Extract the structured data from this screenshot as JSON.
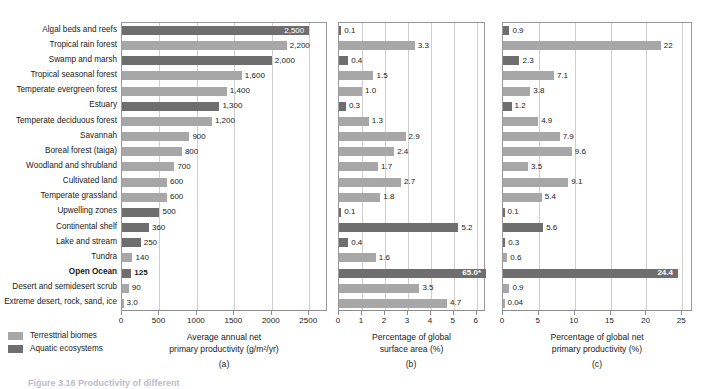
{
  "figure": {
    "caption_fragment": "Figure 3.16 Productivity of different",
    "legend": [
      {
        "key": "terrestrial",
        "label": "Terresttrial biomes",
        "color": "#a7a7a7"
      },
      {
        "key": "aquatic",
        "label": "Aquatic ecosystems",
        "color": "#6e6e6e"
      }
    ],
    "sub_captions": [
      "(a)",
      "(b)",
      "(c)"
    ]
  },
  "categories": [
    {
      "name": "Algal beds and reefs",
      "type": "aquatic",
      "bold": false
    },
    {
      "name": "Tropical rain forest",
      "type": "terrestrial",
      "bold": false
    },
    {
      "name": "Swamp and marsh",
      "type": "aquatic",
      "bold": false
    },
    {
      "name": "Tropical seasonal forest",
      "type": "terrestrial",
      "bold": false
    },
    {
      "name": "Temperate evergreen forest",
      "type": "terrestrial",
      "bold": false
    },
    {
      "name": "Estuary",
      "type": "aquatic",
      "bold": false
    },
    {
      "name": "Temperate deciduous forest",
      "type": "terrestrial",
      "bold": false
    },
    {
      "name": "Savannah",
      "type": "terrestrial",
      "bold": false
    },
    {
      "name": "Boreal forest (taiga)",
      "type": "terrestrial",
      "bold": false
    },
    {
      "name": "Woodland and shrubland",
      "type": "terrestrial",
      "bold": false
    },
    {
      "name": "Cultivated land",
      "type": "terrestrial",
      "bold": false
    },
    {
      "name": "Temperate grassland",
      "type": "terrestrial",
      "bold": false
    },
    {
      "name": "Upwelling zones",
      "type": "aquatic",
      "bold": false
    },
    {
      "name": "Continental shelf",
      "type": "aquatic",
      "bold": false
    },
    {
      "name": "Lake and stream",
      "type": "aquatic",
      "bold": false
    },
    {
      "name": "Tundra",
      "type": "terrestrial",
      "bold": false
    },
    {
      "name": "Open Ocean",
      "type": "aquatic",
      "bold": true
    },
    {
      "name": "Desert and semidesert scrub",
      "type": "terrestrial",
      "bold": false
    },
    {
      "name": "Extreme desert, rock, sand, ice",
      "type": "terrestrial",
      "bold": false
    }
  ],
  "chart_data": [
    {
      "id": "a",
      "type": "bar",
      "orientation": "horizontal",
      "title": "",
      "xlabel": "Average annual net primary productivity (g/m²/yr)",
      "xlabel_line1": "Average annual net",
      "xlabel_line2": "primary productivity (g/m²/yr)",
      "ylabel": "",
      "xlim": [
        0,
        2750
      ],
      "ticks": [
        0,
        500,
        1000,
        1500,
        2000,
        2500
      ],
      "ticklabels": [
        "0",
        "500",
        "1000",
        "1500",
        "2000",
        "2500"
      ],
      "grid": true,
      "legend_position": "bottom-left",
      "categories": [
        "Algal beds and reefs",
        "Tropical rain forest",
        "Swamp and marsh",
        "Tropical seasonal forest",
        "Temperate evergreen forest",
        "Estuary",
        "Temperate deciduous forest",
        "Savannah",
        "Boreal forest (taiga)",
        "Woodland and shrubland",
        "Cultivated land",
        "Temperate grassland",
        "Upwelling zones",
        "Continental shelf",
        "Lake and stream",
        "Tundra",
        "Open Ocean",
        "Desert and semidesert scrub",
        "Extreme desert, rock, sand, ice"
      ],
      "values": [
        2500,
        2200,
        2000,
        1600,
        1400,
        1300,
        1200,
        900,
        800,
        700,
        600,
        600,
        500,
        360,
        250,
        140,
        125,
        90,
        3.0
      ],
      "datalabels": [
        "2,500",
        "2,200",
        "2,000",
        "1,600",
        "1,400",
        "1,300",
        "1,200",
        "900",
        "800",
        "700",
        "600",
        "600",
        "500",
        "360",
        "250",
        "140",
        "125",
        "90",
        "3.0"
      ],
      "label_inside": [
        true,
        false,
        false,
        false,
        false,
        false,
        false,
        false,
        false,
        false,
        false,
        false,
        false,
        false,
        false,
        false,
        false,
        false,
        false
      ]
    },
    {
      "id": "b",
      "type": "bar",
      "orientation": "horizontal",
      "title": "",
      "xlabel": "Percentage of global surface area (%)",
      "xlabel_line1": "Percentage of global",
      "xlabel_line2": "surface area (%)",
      "ylabel": "",
      "xlim": [
        0,
        6.4
      ],
      "ticks": [
        0,
        1,
        2,
        3,
        4,
        5,
        6
      ],
      "ticklabels": [
        "0",
        "1",
        "2",
        "3",
        "4",
        "5",
        "6"
      ],
      "grid": true,
      "categories": [
        "Algal beds and reefs",
        "Tropical rain forest",
        "Swamp and marsh",
        "Tropical seasonal forest",
        "Temperate evergreen forest",
        "Estuary",
        "Temperate deciduous forest",
        "Savannah",
        "Boreal forest (taiga)",
        "Woodland and shrubland",
        "Cultivated land",
        "Temperate grassland",
        "Upwelling zones",
        "Continental shelf",
        "Lake and stream",
        "Tundra",
        "Open Ocean",
        "Desert and semidesert scrub",
        "Extreme desert, rock, sand, ice"
      ],
      "values": [
        0.1,
        3.3,
        0.4,
        1.5,
        1.0,
        0.3,
        1.3,
        2.9,
        2.4,
        1.7,
        2.7,
        1.8,
        0.1,
        5.2,
        0.4,
        1.6,
        65.0,
        3.5,
        4.7
      ],
      "datalabels": [
        "0.1",
        "3.3",
        "0.4",
        "1.5",
        "1.0",
        "0.3",
        "1.3",
        "2.9",
        "2.4",
        "1.7",
        "2.7",
        "1.8",
        "0.1",
        "5.2",
        "0.4",
        "1.6",
        "65.0*",
        "3.5",
        "4.7"
      ],
      "clipped": [
        false,
        false,
        false,
        false,
        false,
        false,
        false,
        false,
        false,
        false,
        false,
        false,
        false,
        false,
        false,
        false,
        true,
        false,
        false
      ],
      "label_inside": [
        false,
        false,
        false,
        false,
        false,
        false,
        false,
        false,
        false,
        false,
        false,
        false,
        false,
        false,
        false,
        false,
        true,
        false,
        false
      ],
      "note": "Open Ocean bar value 65.0 exceeds axis maximum and is drawn full width"
    },
    {
      "id": "c",
      "type": "bar",
      "orientation": "horizontal",
      "title": "",
      "xlabel": "Percentage of global net primary productivity (%)",
      "xlabel_line1": "Percentage of global net",
      "xlabel_line2": "primary productivity (%)",
      "ylabel": "",
      "xlim": [
        0,
        26.5
      ],
      "ticks": [
        0,
        5,
        10,
        15,
        20,
        25
      ],
      "ticklabels": [
        "0",
        "5",
        "10",
        "15",
        "20",
        "25"
      ],
      "grid": true,
      "categories": [
        "Algal beds and reefs",
        "Tropical rain forest",
        "Swamp and marsh",
        "Tropical seasonal forest",
        "Temperate evergreen forest",
        "Estuary",
        "Temperate deciduous forest",
        "Savannah",
        "Boreal forest (taiga)",
        "Woodland and shrubland",
        "Cultivated land",
        "Temperate grassland",
        "Upwelling zones",
        "Continental shelf",
        "Lake and stream",
        "Tundra",
        "Open Ocean",
        "Desert and semidesert scrub",
        "Extreme desert, rock, sand, ice"
      ],
      "values": [
        0.9,
        22,
        2.3,
        7.1,
        3.8,
        1.2,
        4.9,
        7.9,
        9.6,
        3.5,
        9.1,
        5.4,
        0.1,
        5.6,
        0.3,
        0.6,
        24.4,
        0.9,
        0.04
      ],
      "datalabels": [
        "0.9",
        "22",
        "2.3",
        "7.1",
        "3.8",
        "1.2",
        "4.9",
        "7.9",
        "9.6",
        "3.5",
        "9.1",
        "5.4",
        "0.1",
        "5.6",
        "0.3",
        "0.6",
        "24.4",
        "0.9",
        "0.04"
      ],
      "label_inside": [
        false,
        false,
        false,
        false,
        false,
        false,
        false,
        false,
        false,
        false,
        false,
        false,
        false,
        false,
        false,
        false,
        true,
        false,
        false
      ]
    }
  ]
}
